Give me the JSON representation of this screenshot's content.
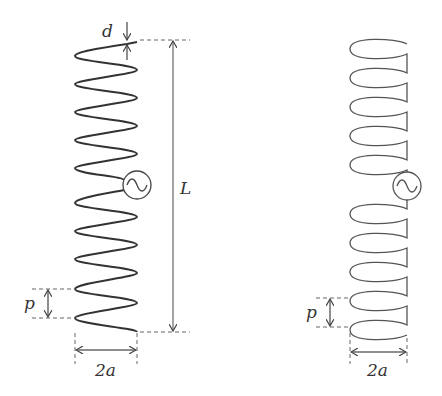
{
  "figure": {
    "left_panel": {
      "name": "normal-mode helical antenna",
      "labels": {
        "wire_diameter": "d",
        "length": "L",
        "pitch": "p",
        "diameter": "2a"
      },
      "turns_above_source": 5,
      "turns_below_source": 5
    },
    "right_panel": {
      "name": "approximated loop-dipole model",
      "labels": {
        "pitch": "p",
        "diameter": "2a"
      },
      "loops_above_source": 5,
      "loops_below_source": 5
    },
    "colors": {
      "line": "#555555",
      "dash": "#666666",
      "text": "#333333"
    }
  }
}
